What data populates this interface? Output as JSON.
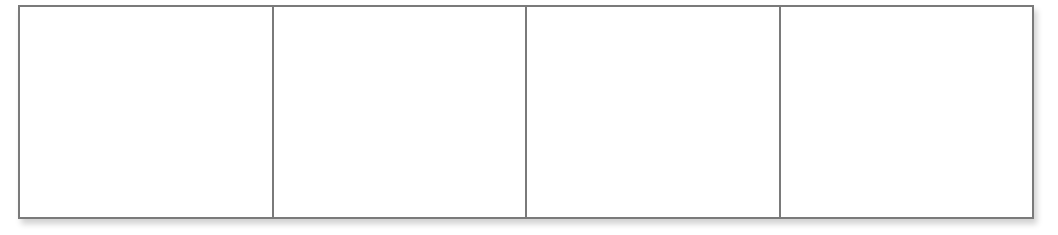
{
  "diagram": {
    "type": "grid",
    "rows": 1,
    "columns": 4,
    "border_color": "#7a7a7a",
    "background_color": "#ffffff",
    "cells": [
      {
        "label": ""
      },
      {
        "label": ""
      },
      {
        "label": ""
      },
      {
        "label": ""
      }
    ]
  }
}
